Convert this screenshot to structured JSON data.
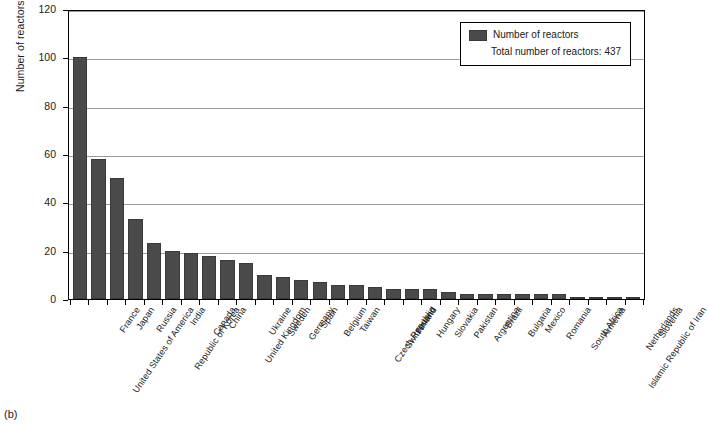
{
  "caption": "(b)",
  "chart_data": {
    "type": "bar",
    "title": "",
    "xlabel": "",
    "ylabel": "Number of reactors",
    "ylim": [
      0,
      120
    ],
    "yticks": [
      0,
      20,
      40,
      60,
      80,
      100,
      120
    ],
    "grid": true,
    "legend_position": "top-right",
    "legend": [
      "Number of reactors",
      "Total number of reactors: 437"
    ],
    "series_name": "Number of reactors",
    "total_label": "Total number of reactors: 437",
    "total": 437,
    "bar_color": "#4a4a4a",
    "categories": [
      "United States of America",
      "France",
      "Japan",
      "Russia",
      "Republic of Korea",
      "India",
      "Canada",
      "China",
      "United Kingdom",
      "Ukraine",
      "Sweden",
      "Germany",
      "Spain",
      "Belgium",
      "Taiwan",
      "Czech Republic",
      "Switzerland",
      "Finland",
      "Hungary",
      "Slovakia",
      "Pakistan",
      "Argentina",
      "Brazil",
      "Bulgaria",
      "Mexico",
      "Romania",
      "South Africa",
      "Armenia",
      "Islamic Republic of Iran",
      "Netherlands",
      "Slovenia"
    ],
    "values": [
      100,
      58,
      50,
      33,
      23,
      20,
      19,
      18,
      16,
      15,
      10,
      9,
      8,
      7,
      6,
      6,
      5,
      4,
      4,
      4,
      3,
      2,
      2,
      2,
      2,
      2,
      2,
      1,
      1,
      1,
      1
    ]
  }
}
